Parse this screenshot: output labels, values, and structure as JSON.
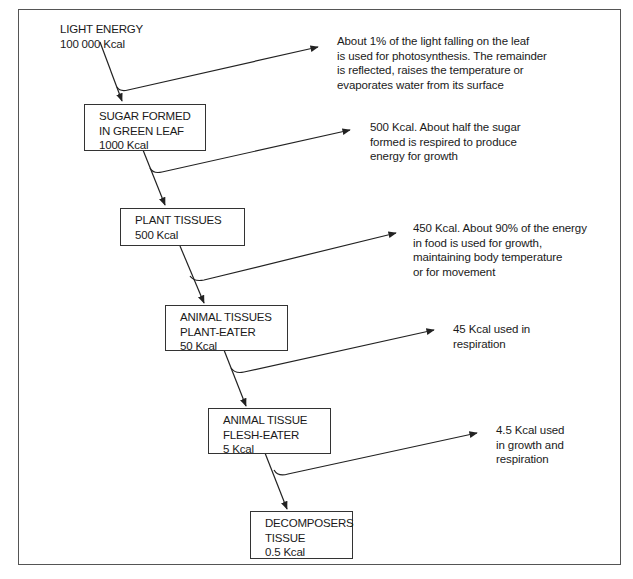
{
  "diagram": {
    "source": {
      "lines": [
        "LIGHT ENERGY",
        "100 000 Kcal"
      ]
    },
    "nodes": [
      {
        "id": "sugar",
        "lines": [
          "SUGAR FORMED",
          "IN GREEN LEAF",
          "1000 Kcal"
        ]
      },
      {
        "id": "plant",
        "lines": [
          "PLANT TISSUES",
          "500 Kcal"
        ]
      },
      {
        "id": "herbivore",
        "lines": [
          "ANIMAL TISSUES",
          "PLANT-EATER",
          "50 Kcal"
        ]
      },
      {
        "id": "carnivore",
        "lines": [
          "ANIMAL TISSUE",
          "FLESH-EATER",
          "5 Kcal"
        ]
      },
      {
        "id": "decomposer",
        "lines": [
          "DECOMPOSERS",
          "TISSUE",
          "0.5 Kcal"
        ]
      }
    ],
    "losses": [
      {
        "lines": [
          "About 1% of the light falling on the leaf",
          "is used for photosynthesis. The remainder",
          "is reflected, raises the temperature or",
          "evaporates water from its surface"
        ]
      },
      {
        "lines": [
          "500 Kcal. About half the sugar",
          "formed is respired to produce",
          "energy for growth"
        ]
      },
      {
        "lines": [
          "450 Kcal. About 90% of the energy",
          "in food is used for growth,",
          "maintaining body temperature",
          "or for movement"
        ]
      },
      {
        "lines": [
          "45 Kcal used in",
          "respiration"
        ]
      },
      {
        "lines": [
          "4.5 Kcal used",
          "in growth and",
          "respiration"
        ]
      }
    ],
    "colors": {
      "line": "#222222",
      "frame": "#555555",
      "text": "#1a1a1a",
      "background": "#ffffff"
    }
  }
}
